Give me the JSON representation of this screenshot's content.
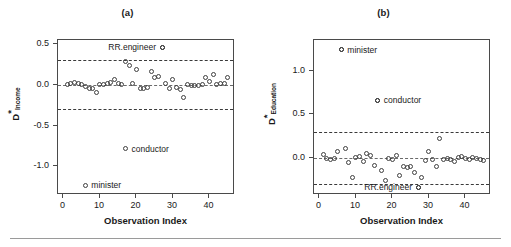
{
  "figure": {
    "bottom_rule": true,
    "background": "#ffffff",
    "point_color": "#3f3f3f"
  },
  "chart_data": [
    {
      "type": "scatter",
      "panel": "a",
      "title": "(a)",
      "xlabel": "Observation Index",
      "ylabel": "D*Income",
      "ylabel_main": "D",
      "ylabel_star": "*",
      "ylabel_sub": "Income",
      "xlim": [
        -1.5,
        47
      ],
      "ylim": [
        -1.35,
        0.55
      ],
      "xticks": [
        0,
        10,
        20,
        30,
        40
      ],
      "xticklabels": [
        "0",
        "10",
        "20",
        "30",
        "40"
      ],
      "yticks": [
        0.5,
        0.0,
        -0.5,
        -1.0
      ],
      "yticklabels": [
        "0.5",
        "0.0",
        "-0.5",
        "-1.0"
      ],
      "grid": false,
      "reference_lines": [
        {
          "y": 0.3,
          "style": "dashed"
        },
        {
          "y": 0.0,
          "style": "dashed"
        },
        {
          "y": -0.3,
          "style": "dashed"
        }
      ],
      "x": [
        1,
        2,
        3,
        4,
        5,
        6,
        7,
        8,
        9,
        10,
        11,
        12,
        13,
        14,
        15,
        16,
        17,
        18,
        19,
        20,
        21,
        22,
        23,
        24,
        25,
        26,
        27,
        28,
        29,
        30,
        31,
        32,
        33,
        34,
        35,
        36,
        37,
        38,
        39,
        40,
        41,
        42,
        43,
        44,
        45
      ],
      "y": [
        0.01,
        0.02,
        0.03,
        0.02,
        0.01,
        -0.02,
        -0.04,
        -0.05,
        -0.09,
        0.0,
        0.01,
        0.02,
        0.03,
        0.06,
        0.02,
        0.0,
        0.29,
        0.24,
        0.02,
        0.19,
        -0.04,
        -0.05,
        -0.03,
        0.17,
        0.09,
        0.1,
        0.46,
        0.02,
        -0.05,
        0.06,
        -0.03,
        -0.06,
        -0.16,
        0.0,
        -0.01,
        -0.01,
        -0.01,
        0.0,
        0.09,
        0.04,
        0.13,
        0.01,
        0.02,
        0.02,
        0.09
      ],
      "annotations": [
        {
          "label": "RR.engineer",
          "x": 27,
          "y": 0.46,
          "side": "left"
        },
        {
          "label": "conductor",
          "x": 17,
          "y": -0.78,
          "side": "right"
        },
        {
          "label": "minister",
          "x": 6,
          "y": -1.23,
          "side": "right"
        }
      ]
    },
    {
      "type": "scatter",
      "panel": "b",
      "title": "(b)",
      "xlabel": "Observation Index",
      "ylabel": "D*Education",
      "ylabel_main": "D",
      "ylabel_star": "*",
      "ylabel_sub": "Education",
      "xlim": [
        -1.5,
        47
      ],
      "ylim": [
        -0.42,
        1.35
      ],
      "xticks": [
        0,
        10,
        20,
        30,
        40
      ],
      "xticklabels": [
        "0",
        "10",
        "20",
        "30",
        "40"
      ],
      "yticks": [
        1.0,
        0.5,
        0.0
      ],
      "yticklabels": [
        "1.0",
        "0.5",
        "0.0"
      ],
      "grid": false,
      "reference_lines": [
        {
          "y": 0.3,
          "style": "dashed"
        },
        {
          "y": 0.0,
          "style": "dashed"
        },
        {
          "y": -0.3,
          "style": "dashed"
        }
      ],
      "x": [
        1,
        2,
        3,
        4,
        5,
        6,
        7,
        8,
        9,
        10,
        11,
        12,
        13,
        14,
        15,
        16,
        17,
        18,
        19,
        20,
        21,
        22,
        23,
        24,
        25,
        26,
        27,
        28,
        29,
        30,
        31,
        32,
        33,
        34,
        35,
        36,
        37,
        38,
        39,
        40,
        41,
        42,
        43,
        44,
        45
      ],
      "y": [
        0.04,
        0.0,
        -0.01,
        0.0,
        0.08,
        1.24,
        0.11,
        -0.05,
        -0.22,
        0.01,
        0.02,
        -0.04,
        0.05,
        0.03,
        -0.08,
        0.66,
        -0.14,
        -0.26,
        0.0,
        -0.01,
        0.03,
        -0.2,
        -0.09,
        -0.11,
        -0.09,
        -0.16,
        -0.33,
        -0.22,
        -0.03,
        0.08,
        -0.02,
        -0.1,
        0.22,
        -0.01,
        0.0,
        -0.01,
        -0.04,
        0.01,
        0.02,
        0.0,
        -0.01,
        0.01,
        0.0,
        -0.01,
        -0.03
      ],
      "annotations": [
        {
          "label": "minister",
          "x": 6,
          "y": 1.24,
          "side": "right"
        },
        {
          "label": "conductor",
          "x": 16,
          "y": 0.66,
          "side": "right"
        },
        {
          "label": "RR.engineer",
          "x": 27,
          "y": -0.33,
          "side": "left"
        }
      ]
    }
  ]
}
